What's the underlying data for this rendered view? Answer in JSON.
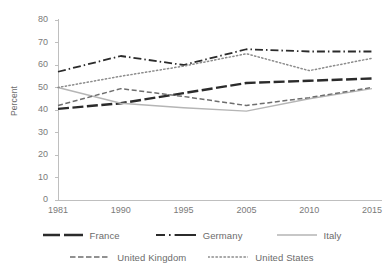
{
  "chart_data": {
    "type": "line",
    "title": "",
    "subtitle": "",
    "xlabel": "",
    "ylabel": "Percent",
    "categories": [
      "1981",
      "1990",
      "1995",
      "2005",
      "2010",
      "2015"
    ],
    "ylim": [
      0,
      80
    ],
    "yticks": [
      "0",
      "10",
      "20",
      "30",
      "40",
      "50",
      "60",
      "70",
      "80"
    ],
    "ytick_values": [
      0,
      10,
      20,
      30,
      40,
      50,
      60,
      70,
      80
    ],
    "grid": false,
    "legend_position": "bottom",
    "series": [
      {
        "name": "France",
        "values": [
          40.5,
          43,
          47.5,
          52,
          53,
          54
        ],
        "color": "#2b2b2b",
        "style": "long-dash",
        "width": 2.4
      },
      {
        "name": "Germany",
        "values": [
          57,
          64,
          60,
          67,
          66,
          66
        ],
        "color": "#2b2b2b",
        "style": "dash-dot",
        "width": 1.8
      },
      {
        "name": "Italy",
        "values": [
          50,
          43,
          41,
          39.5,
          45,
          49.5
        ],
        "color": "#b5b5b5",
        "style": "solid",
        "width": 1.3
      },
      {
        "name": "United Kingdom",
        "values": [
          42,
          49.5,
          46,
          42,
          45.5,
          50
        ],
        "color": "#6e6e6e",
        "style": "dash",
        "width": 1.5
      },
      {
        "name": "United States",
        "values": [
          50,
          55,
          59.5,
          65,
          57.5,
          63
        ],
        "color": "#8c8c8c",
        "style": "dot",
        "width": 1.5
      }
    ]
  },
  "legend": {
    "items": [
      {
        "label": "France"
      },
      {
        "label": "Germany"
      },
      {
        "label": "Italy"
      },
      {
        "label": "United Kingdom"
      },
      {
        "label": "United States"
      }
    ]
  },
  "axes": {
    "y_axis_title": "Percent",
    "axis_color": "#bfbfbf"
  }
}
